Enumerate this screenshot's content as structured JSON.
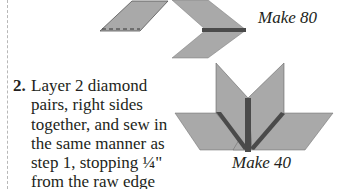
{
  "figures": {
    "top": {
      "caption": "Make 80"
    },
    "bottom": {
      "caption": "Make 40"
    }
  },
  "step": {
    "number": "2.",
    "text": "Layer 2 diamond pairs, right sides together, and sew in the same manner as step 1, stopping ¼\" from the raw edge with a backstitch."
  },
  "colors": {
    "fabric": "#a9a9a9",
    "seam": "#4a4a4a",
    "outline": "#555555"
  }
}
